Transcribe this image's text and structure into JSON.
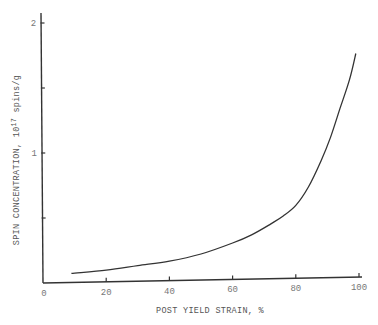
{
  "chart_data": {
    "type": "line",
    "title": "",
    "xlabel": "POST YIELD STRAIN, %",
    "ylabel_main": "SPIN CONCENTRATION, 10",
    "ylabel_exp": "17",
    "ylabel_unit": " spins/g",
    "ylabel": "SPIN CONCENTRATION, 10^17 spins/g",
    "xlim": [
      0,
      100
    ],
    "ylim": [
      0,
      2
    ],
    "x_ticks": [
      0,
      20,
      40,
      60,
      80,
      100
    ],
    "x_tick_labels": [
      "0",
      "20",
      "40",
      "60",
      "80",
      "100"
    ],
    "y_ticks": [
      0.5,
      1,
      1.5,
      2
    ],
    "y_tick_labels": [
      "",
      "1",
      "",
      "2"
    ],
    "grid": false,
    "legend": null,
    "series": [
      {
        "name": "spin concentration",
        "x": [
          9,
          20,
          30,
          40,
          50,
          60,
          66,
          72,
          76,
          80,
          84,
          88,
          91,
          94,
          97,
          99
        ],
        "y": [
          0.07,
          0.09,
          0.12,
          0.15,
          0.2,
          0.28,
          0.34,
          0.42,
          0.48,
          0.56,
          0.7,
          0.9,
          1.08,
          1.3,
          1.52,
          1.72
        ]
      }
    ]
  }
}
